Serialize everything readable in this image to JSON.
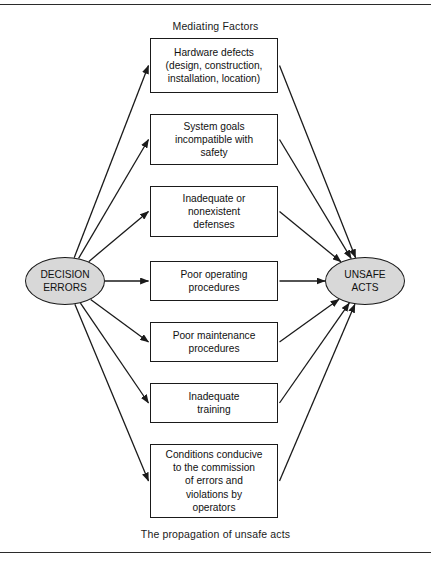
{
  "figure": {
    "heading": "Mediating Factors",
    "caption": "The propagation of unsafe acts",
    "width": 431,
    "height": 565,
    "colors": {
      "line": "#1a1a1a",
      "ellipse_fill": "#d8d8d8",
      "box_fill": "#ffffff",
      "rule": "#2b2b2b",
      "background": "#ffffff"
    }
  },
  "source_node": {
    "label": "DECISION\nERRORS",
    "shape": "ellipse",
    "cx": 65,
    "cy": 281,
    "rx": 40,
    "ry": 24
  },
  "target_node": {
    "label": "UNSAFE\nACTS",
    "shape": "ellipse",
    "cx": 365,
    "cy": 281,
    "rx": 40,
    "ry": 24
  },
  "mediating_factors": [
    {
      "id": "hardware-defects",
      "label": "Hardware defects\n(design, construction,\ninstallation, location)",
      "x": 150,
      "y": 38,
      "w": 128,
      "h": 55
    },
    {
      "id": "system-goals",
      "label": "System goals\nincompatible with\nsafety",
      "x": 150,
      "y": 114,
      "w": 128,
      "h": 51
    },
    {
      "id": "inadequate-defenses",
      "label": "Inadequate or\nnonexistent\ndefenses",
      "x": 150,
      "y": 186,
      "w": 128,
      "h": 51
    },
    {
      "id": "poor-operating",
      "label": "Poor operating\nprocedures",
      "x": 150,
      "y": 261,
      "w": 128,
      "h": 40
    },
    {
      "id": "poor-maintenance",
      "label": "Poor maintenance\nprocedures",
      "x": 150,
      "y": 322,
      "w": 128,
      "h": 40
    },
    {
      "id": "inadequate-training",
      "label": "Inadequate\ntraining",
      "x": 150,
      "y": 383,
      "w": 128,
      "h": 40
    },
    {
      "id": "conditions-conducive",
      "label": "Conditions conducive\nto the commission\nof errors and\nviolations by\noperators",
      "x": 150,
      "y": 444,
      "w": 128,
      "h": 74
    }
  ],
  "edges": {
    "from_source_count": 7,
    "to_target_count": 7,
    "style": "solid-arrow"
  }
}
